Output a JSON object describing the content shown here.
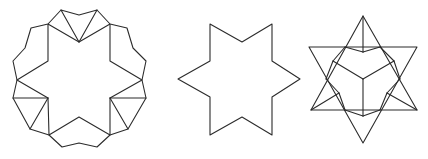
{
  "diagram": {
    "background": "#ffffff",
    "stroke_color": "#2b2b2b",
    "figures": [
      {
        "name": "twelve-sided-star-with-triangles",
        "description": "Hexagram core surrounded by six folded triangle pairs forming a 12-lobed outline",
        "outline": [
          [
            61,
            10
          ],
          [
            79,
            15
          ],
          [
            97,
            10
          ],
          [
            110,
            24
          ],
          [
            127,
            28
          ],
          [
            133,
            48
          ],
          [
            146,
            61
          ],
          [
            142,
            80
          ],
          [
            146,
            98
          ],
          [
            128,
            129
          ],
          [
            110,
            135
          ],
          [
            97,
            147
          ],
          [
            79,
            143
          ],
          [
            62,
            147
          ],
          [
            49,
            135
          ],
          [
            30,
            129
          ],
          [
            13,
            98
          ],
          [
            17,
            80
          ],
          [
            13,
            61
          ],
          [
            25,
            48
          ],
          [
            31,
            28
          ],
          [
            48,
            24
          ]
        ],
        "inner_star": [
          [
            48,
            24
          ],
          [
            79,
            42
          ],
          [
            110,
            24
          ],
          [
            110,
            61
          ],
          [
            142,
            80
          ],
          [
            110,
            98
          ],
          [
            110,
            135
          ],
          [
            79,
            117
          ],
          [
            49,
            135
          ],
          [
            48,
            98
          ],
          [
            17,
            80
          ],
          [
            48,
            61
          ]
        ],
        "extra_lines": [
          [
            [
              61,
              10
            ],
            [
              79,
              42
            ]
          ],
          [
            [
              97,
              10
            ],
            [
              79,
              42
            ]
          ],
          [
            [
              13,
              98
            ],
            [
              48,
              98
            ]
          ],
          [
            [
              30,
              129
            ],
            [
              48,
              98
            ]
          ],
          [
            [
              146,
              98
            ],
            [
              110,
              98
            ]
          ],
          [
            [
              128,
              129
            ],
            [
              110,
              98
            ]
          ]
        ]
      },
      {
        "name": "six-pointed-star",
        "description": "Plain hexagram outline",
        "outline": [
          [
            210,
            24
          ],
          [
            242,
            42
          ],
          [
            272,
            24
          ],
          [
            272,
            61
          ],
          [
            300,
            79
          ],
          [
            272,
            97
          ],
          [
            272,
            135
          ],
          [
            242,
            117
          ],
          [
            210,
            135
          ],
          [
            210,
            97
          ],
          [
            178,
            79
          ],
          [
            210,
            61
          ]
        ]
      },
      {
        "name": "stellated-cube-star",
        "description": "Two overlapping triangles with an inner isometric cube and folded flaps",
        "triangle_up": [
          [
            363,
            16
          ],
          [
            417,
            110
          ],
          [
            311,
            110
          ]
        ],
        "triangle_down": [
          [
            309,
            47
          ],
          [
            417,
            47
          ],
          [
            363,
            143
          ]
        ],
        "lines": [
          [
            [
              363,
              16
            ],
            [
              363,
              52
            ]
          ],
          [
            [
              345,
              47
            ],
            [
              363,
              52
            ]
          ],
          [
            [
              380,
              47
            ],
            [
              363,
              52
            ]
          ],
          [
            [
              345,
              47
            ],
            [
              333,
              61
            ]
          ],
          [
            [
              380,
              47
            ],
            [
              394,
              61
            ]
          ],
          [
            [
              333,
              61
            ],
            [
              363,
              79
            ]
          ],
          [
            [
              394,
              61
            ],
            [
              363,
              79
            ]
          ],
          [
            [
              363,
              79
            ],
            [
              363,
              116
            ]
          ],
          [
            [
              333,
              61
            ],
            [
              326,
              79
            ]
          ],
          [
            [
              394,
              61
            ],
            [
              400,
              79
            ]
          ],
          [
            [
              326,
              79
            ],
            [
              339,
              93
            ]
          ],
          [
            [
              400,
              79
            ],
            [
              387,
              93
            ]
          ],
          [
            [
              339,
              93
            ],
            [
              345,
              110
            ]
          ],
          [
            [
              387,
              93
            ],
            [
              380,
              110
            ]
          ],
          [
            [
              311,
              110
            ],
            [
              339,
              93
            ]
          ],
          [
            [
              417,
              110
            ],
            [
              387,
              93
            ]
          ],
          [
            [
              345,
              110
            ],
            [
              363,
              116
            ]
          ],
          [
            [
              380,
              110
            ],
            [
              363,
              116
            ]
          ]
        ]
      }
    ]
  }
}
